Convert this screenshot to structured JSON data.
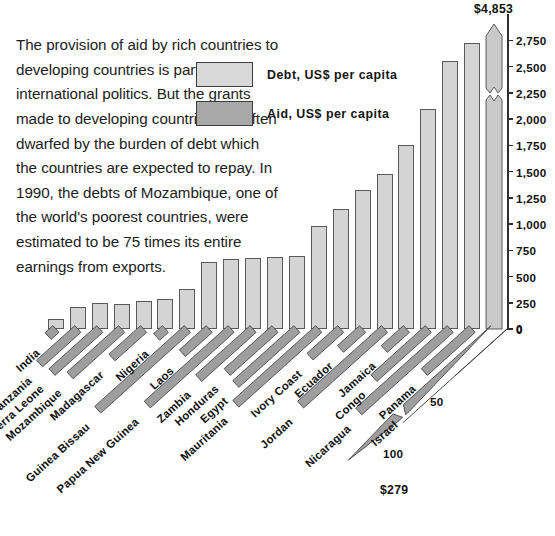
{
  "intro": {
    "text": "The provision of aid by rich countries to developing countries is part of international politics. But the grants made to developing countries are often dwarfed by the burden of debt which the countries are expected to repay. In 1990, the debts of Mozambique, one of the world's poorest countries, were estimated to be 75 times its entire earnings from exports."
  },
  "legend": {
    "items": [
      {
        "label": "Debt, US$ per capita",
        "color": "#d8d8d8",
        "swatch_name": "debt-swatch"
      },
      {
        "label": "Aid, US$ per capita",
        "color": "#a8a8a8",
        "swatch_name": "aid-swatch"
      }
    ]
  },
  "annotations": {
    "top_value": "$4,853",
    "israel_aid_value": "$279",
    "aid_tick_50": "50",
    "aid_tick_100": "100",
    "aid_tick_0": "0"
  },
  "chart_data": {
    "type": "bar",
    "title": "",
    "subtitle": "",
    "xlabel": "",
    "ylabel": "",
    "grid": false,
    "legend_position": "top-right",
    "ylim": [
      0,
      3000
    ],
    "yticks": [
      0,
      250,
      500,
      750,
      1000,
      1250,
      1500,
      1750,
      2000,
      2250,
      2500,
      2750
    ],
    "ytick_labels": [
      "0",
      "250",
      "500",
      "750",
      "1,000",
      "1,250",
      "1,500",
      "1,750",
      "2,000",
      "2,250",
      "2,500",
      "2,750"
    ],
    "aid_axis": {
      "ticks": [
        0,
        50,
        100
      ],
      "tick_labels": [
        "0",
        "50",
        "100"
      ],
      "lim": [
        0,
        120
      ]
    },
    "categories": [
      "India",
      "Tanzania",
      "Sierra Leone",
      "Mozambique",
      "Madagascar",
      "Nigeria",
      "Guinea Bissau",
      "Laos",
      "Papua New Guinea",
      "Zambia",
      "Honduras",
      "Egypt",
      "Mauritania",
      "Ivory Coast",
      "Ecuador",
      "Jordan",
      "Jamaica",
      "Congo",
      "Nicaragua",
      "Panama",
      "Israel"
    ],
    "series": [
      {
        "name": "Debt, US$ per capita",
        "color": "#d4d4d4",
        "values": [
          95,
          210,
          245,
          235,
          270,
          290,
          380,
          640,
          670,
          680,
          690,
          700,
          980,
          1140,
          1320,
          1480,
          1750,
          2100,
          2550,
          2720,
          4853
        ],
        "broken_bar_index": 20,
        "broken_bar_label": "$4,853"
      },
      {
        "name": "Aid, US$ per capita",
        "color": "#a8a8a8",
        "values": [
          2,
          34,
          44,
          48,
          27,
          3,
          88,
          22,
          82,
          51,
          44,
          58,
          81,
          26,
          17,
          82,
          17,
          51,
          90,
          44,
          279
        ],
        "broken_bar_index": 20,
        "broken_bar_label": "$279"
      }
    ]
  }
}
